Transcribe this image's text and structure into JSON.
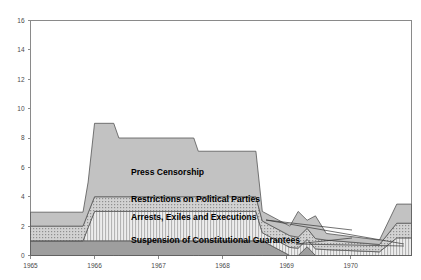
{
  "chart_data": {
    "type": "area",
    "title": "",
    "subtitle": "",
    "xlabel": "",
    "ylabel": "",
    "stacked": true,
    "grid": false,
    "legend_position": "inline-annotations",
    "xlim": [
      1965,
      1970.95
    ],
    "ylim": [
      0,
      16
    ],
    "yticks": [
      0,
      2,
      4,
      6,
      8,
      10,
      12,
      14,
      16
    ],
    "ytick_labels": [
      "0",
      "2",
      "4",
      "6",
      "8",
      "10",
      "12",
      "14",
      "16"
    ],
    "xticks": [
      1965,
      1966,
      1967,
      1968,
      1969,
      1970
    ],
    "xtick_labels": [
      "1965",
      "1966",
      "1967",
      "1968",
      "1969",
      "1970"
    ],
    "x": [
      1965.0,
      1965.82,
      1965.9,
      1966.0,
      1966.3,
      1966.38,
      1967.55,
      1967.62,
      1968.52,
      1968.62,
      1969.05,
      1969.18,
      1969.32,
      1969.45,
      1969.62,
      1970.45,
      1970.72,
      1970.95
    ],
    "series": [
      {
        "name": "Suspension of Constitutional Guarantees",
        "fill": "#9e9e9e",
        "pattern": "solid",
        "values": [
          1.0,
          1.0,
          1.0,
          1.0,
          1.0,
          1.0,
          1.0,
          1.0,
          1.0,
          1.0,
          0.0,
          0.0,
          0.6,
          0.0,
          0.0,
          0.0,
          0.0,
          0.0
        ]
      },
      {
        "name": "Arrests, Exiles and Executions",
        "fill": "#cfcfcf",
        "pattern": "vertical-stripes",
        "values": [
          0.0,
          0.0,
          0.9,
          2.0,
          2.0,
          2.0,
          2.0,
          2.0,
          2.0,
          0.55,
          0.55,
          0.5,
          0.5,
          0.45,
          0.4,
          0.25,
          1.2,
          1.2
        ]
      },
      {
        "name": "Restrictions on Political Parties",
        "fill": "#c6c6c6",
        "pattern": "dots",
        "values": [
          1.0,
          1.0,
          1.0,
          1.0,
          1.0,
          1.0,
          1.0,
          1.0,
          1.0,
          0.8,
          0.8,
          0.75,
          0.75,
          0.7,
          0.65,
          0.5,
          1.0,
          1.0
        ]
      },
      {
        "name": "Press Censorship",
        "fill": "#c2c2c2",
        "pattern": "solid",
        "values": [
          0.95,
          0.95,
          2.1,
          5.0,
          5.0,
          4.0,
          4.0,
          3.1,
          3.1,
          0.65,
          0.65,
          1.75,
          0.55,
          1.55,
          0.45,
          0.3,
          1.3,
          1.3
        ]
      }
    ],
    "annotations": [
      {
        "name": "press-censorship",
        "text": "Press Censorship",
        "x": 131,
        "y": 175
      },
      {
        "name": "restrictions-on-political-parties",
        "text": "Restrictions on Political Parties",
        "x": 131,
        "y": 202
      },
      {
        "name": "arrests-exiles-and-executions",
        "text": "Arrests, Exiles and Executions",
        "x": 131,
        "y": 220
      },
      {
        "name": "suspension-of-constitutional-guarantees",
        "text": "Suspension of Constitutional Guarantees",
        "x": 131,
        "y": 243
      }
    ]
  },
  "colors": {
    "axis": "#8a8a8a",
    "outline": "#555555",
    "background": "#ffffff",
    "tick_text": "#4a4a4a",
    "annotation_text": "#000000"
  }
}
